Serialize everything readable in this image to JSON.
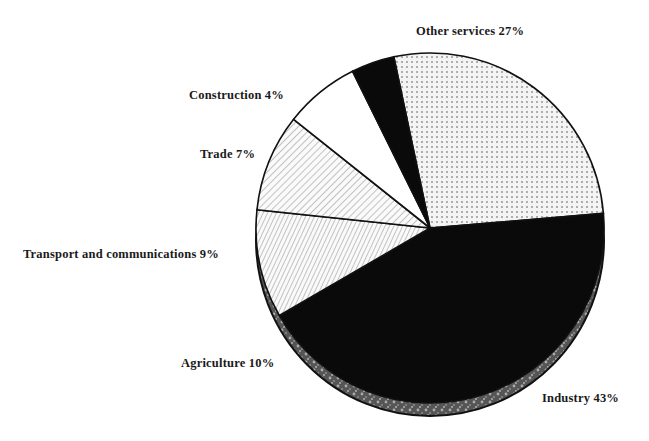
{
  "chart_data": {
    "type": "pie",
    "title": "",
    "style": "3d-pie-monochrome-patterns",
    "slices": [
      {
        "label": "Other services",
        "value": 27,
        "pattern": "dots",
        "display": "Other services 27%"
      },
      {
        "label": "Industry",
        "value": 43,
        "pattern": "solid-black",
        "display": "Industry 43%"
      },
      {
        "label": "Agriculture",
        "value": 10,
        "pattern": "vertical-hatch",
        "display": "Agriculture 10%"
      },
      {
        "label": "Transport and communications",
        "value": 9,
        "pattern": "diagonal-hatch",
        "display": "Transport and communications 9%"
      },
      {
        "label": "Trade",
        "value": 7,
        "pattern": "white",
        "display": "Trade 7%"
      },
      {
        "label": "Construction",
        "value": 4,
        "pattern": "solid-black",
        "display": "Construction 4%"
      }
    ],
    "unit": "%",
    "legend": "none (direct labels)"
  },
  "labels": {
    "other_services": "Other services 27%",
    "industry": "Industry 43%",
    "agriculture": "Agriculture 10%",
    "transport": "Transport and communications 9%",
    "trade": "Trade 7%",
    "construction": "Construction 4%"
  }
}
